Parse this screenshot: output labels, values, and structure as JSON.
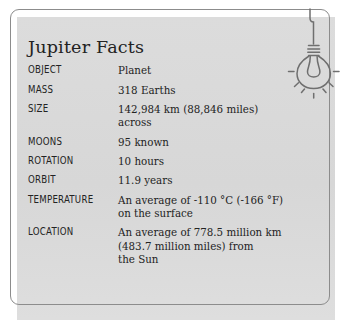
{
  "card": {
    "title": "Jupiter Facts",
    "icon": "lightbulb-hanging-icon",
    "panel_color": "#d9d9d9",
    "border_color": "#8c8c8c",
    "text_color": "#232323",
    "facts": [
      {
        "label": "OBJECT",
        "value_lines": [
          "Planet"
        ]
      },
      {
        "label": "MASS",
        "value_lines": [
          "318 Earths"
        ]
      },
      {
        "label": "SIZE",
        "value_lines": [
          "142,984 km (88,846 miles) across"
        ]
      },
      {
        "label": "MOONS",
        "value_lines": [
          "95 known"
        ]
      },
      {
        "label": "ROTATION",
        "value_lines": [
          "10 hours"
        ]
      },
      {
        "label": "ORBIT",
        "value_lines": [
          "11.9 years"
        ]
      },
      {
        "label": "TEMPERATURE",
        "value_lines": [
          "An average of -110 °C (-166 °F)",
          "on the surface"
        ]
      },
      {
        "label": "LOCATION",
        "value_lines": [
          "An average of 778.5 million km",
          "(483.7 million miles) from",
          "the Sun"
        ]
      }
    ]
  }
}
